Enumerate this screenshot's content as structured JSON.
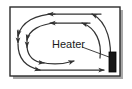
{
  "figure": {
    "background_color": "#ffffff"
  },
  "enclosure": {
    "name": "room-outline",
    "border_color": "#2b2b2b",
    "fill_color": "#ffffff",
    "shadow_color": "#a8a8a8",
    "x": 10,
    "y": 7,
    "width": 110,
    "height": 69
  },
  "heater": {
    "label": "Heater",
    "label_color": "#1a1a1a",
    "body_color": "#161616",
    "outline_color": "#000000",
    "x": 109,
    "y": 52,
    "width": 7,
    "height": 20,
    "leader_line": true
  },
  "flow": {
    "arrow_color": "#333333",
    "direction_summary": "counter-clockwise loop: up the right wall, leftward across the top, down the left wall, rightward along the floor",
    "arrows": [
      {
        "id": "top-outer-left",
        "direction": "left",
        "label": ""
      },
      {
        "id": "top-inner-left",
        "direction": "left",
        "label": ""
      },
      {
        "id": "left-outer-down",
        "direction": "down",
        "label": ""
      },
      {
        "id": "left-inner-down",
        "direction": "down",
        "label": ""
      },
      {
        "id": "bottom-outer-right",
        "direction": "right",
        "label": ""
      },
      {
        "id": "bottom-inner-right",
        "direction": "right",
        "label": ""
      },
      {
        "id": "floor-right",
        "direction": "right",
        "label": ""
      },
      {
        "id": "right-outer-up",
        "direction": "up",
        "label": ""
      },
      {
        "id": "right-inner-up",
        "direction": "up",
        "label": ""
      }
    ]
  }
}
